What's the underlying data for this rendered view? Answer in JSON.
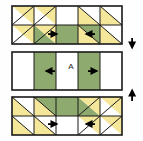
{
  "diagram": {
    "type": "quilt-piecing-diagram",
    "label_a": "A",
    "colors": {
      "green": "#8faa6e",
      "green_dark": "#7e9b5f",
      "yellow": "#f5e79a",
      "yellow_dark": "#ebd87c",
      "white": "#ffffff",
      "outline": "#1a1a1a",
      "background": "#fefefe",
      "arrow": "#000000"
    },
    "rows": [
      {
        "name": "top-block",
        "label": "Top sashing block",
        "units": [
          {
            "position": "r1c1",
            "type": "half-square-triangle",
            "fill": "yellow",
            "triangle_corner": "upper-right"
          },
          {
            "position": "r1c2",
            "type": "half-square-triangle",
            "fill": "yellow",
            "triangle_corner": "upper-right"
          },
          {
            "position": "r1c3",
            "type": "plain-square",
            "fill": "white"
          },
          {
            "position": "r1c4",
            "type": "half-square-triangle",
            "fill": "yellow",
            "triangle_corner": "lower-left"
          },
          {
            "position": "r1c5",
            "type": "half-square-triangle",
            "fill": "yellow",
            "triangle_corner": "lower-left"
          },
          {
            "position": "r2c1",
            "type": "half-square-triangle",
            "fill": "yellow",
            "triangle_corner": "upper-right"
          },
          {
            "position": "r2c2",
            "type": "half-square-triangle",
            "fill": "yellow",
            "triangle_corner": "upper-right"
          },
          {
            "position": "r2c3",
            "type": "plain-square",
            "fill": "green"
          },
          {
            "position": "r2c4",
            "type": "half-square-triangle",
            "fill": "yellow",
            "triangle_corner": "lower-left"
          },
          {
            "position": "r2c5",
            "type": "half-square-triangle",
            "fill": "yellow",
            "triangle_corner": "lower-left"
          }
        ],
        "seam_arrows": [
          {
            "name": "seam-arrow-left",
            "direction": "right"
          },
          {
            "name": "seam-arrow-right",
            "direction": "left"
          }
        ]
      },
      {
        "name": "middle-block",
        "label": "Center strip block",
        "units": [
          {
            "position": "c1",
            "type": "strip",
            "fill": "white"
          },
          {
            "position": "c2",
            "type": "strip",
            "fill": "green"
          },
          {
            "position": "c3",
            "type": "strip",
            "fill": "white"
          },
          {
            "position": "c4",
            "type": "strip",
            "fill": "green"
          },
          {
            "position": "c5",
            "type": "strip",
            "fill": "white"
          }
        ],
        "seam_arrows": [
          {
            "name": "seam-arrow-left",
            "direction": "left"
          },
          {
            "name": "seam-arrow-right",
            "direction": "right"
          }
        ]
      },
      {
        "name": "bottom-block",
        "label": "Bottom sashing block",
        "units": [
          {
            "position": "r1c1",
            "type": "half-square-triangle",
            "fill": "yellow",
            "triangle_corner": "lower-left"
          },
          {
            "position": "r1c2",
            "type": "half-square-triangle",
            "fill": "yellow",
            "triangle_corner": "lower-left"
          },
          {
            "position": "r1c3",
            "type": "plain-square",
            "fill": "green"
          },
          {
            "position": "r1c4",
            "type": "half-square-triangle",
            "fill": "yellow",
            "triangle_corner": "upper-right"
          },
          {
            "position": "r1c5",
            "type": "half-square-triangle",
            "fill": "yellow",
            "triangle_corner": "upper-right"
          },
          {
            "position": "r2c1",
            "type": "half-square-triangle",
            "fill": "yellow",
            "triangle_corner": "lower-left"
          },
          {
            "position": "r2c2",
            "type": "half-square-triangle",
            "fill": "yellow",
            "triangle_corner": "lower-left"
          },
          {
            "position": "r2c3",
            "type": "plain-square",
            "fill": "white"
          },
          {
            "position": "r2c4",
            "type": "half-square-triangle",
            "fill": "yellow",
            "triangle_corner": "upper-right"
          },
          {
            "position": "r2c5",
            "type": "half-square-triangle",
            "fill": "yellow",
            "triangle_corner": "upper-right"
          }
        ],
        "seam_arrows": [
          {
            "name": "seam-arrow-left",
            "direction": "right"
          },
          {
            "name": "seam-arrow-right",
            "direction": "left"
          }
        ]
      }
    ],
    "side_arrows": [
      {
        "name": "join-arrow-down",
        "direction": "down"
      },
      {
        "name": "join-arrow-up",
        "direction": "up"
      }
    ]
  }
}
